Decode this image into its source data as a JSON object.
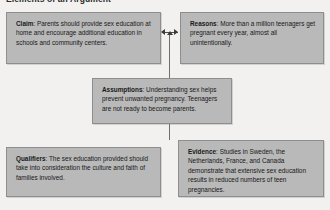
{
  "header": {
    "title": "Elements of an Argument"
  },
  "diagram": {
    "type": "toulmin-argument-map",
    "background_color": "#f2f1ef",
    "box_fill_color": "#b9b9b9",
    "box_border_color": "#8e8e8e",
    "connector_color": "#3a3a3a",
    "boxes": [
      {
        "id": "claim",
        "lead": "Claim",
        "separator": ": ",
        "text": "Parents should provide sex education at home and encourage additional education in schools and community centers."
      },
      {
        "id": "reasons",
        "lead": "Reasons",
        "separator": ": ",
        "text": "More than a million teenagers get pregnant every year, almost all unintentionally."
      },
      {
        "id": "assumptions",
        "lead": "Assumptions",
        "separator": ": ",
        "text": "Understanding sex helps prevent unwanted pregnancy. Teenagers are not ready to become parents."
      },
      {
        "id": "qualifiers",
        "lead": "Qualifiers",
        "separator": ": ",
        "text": "The sex education provided should take into consideration the culture and faith of families involved."
      },
      {
        "id": "evidence",
        "lead": "Evidence",
        "separator": ": ",
        "text": "Studies in Sweden, the Netherlands, France, and Canada demonstrate that extensive sex education results in reduced numbers of teen pregnancies."
      }
    ],
    "connectors": [
      {
        "id": "claim-reasons",
        "style": "double-headed-horizontal-arrow"
      },
      {
        "id": "to-assumptions",
        "style": "vertical-line-with-up-arrow"
      },
      {
        "id": "assumptions-down",
        "style": "vertical-line"
      }
    ]
  }
}
